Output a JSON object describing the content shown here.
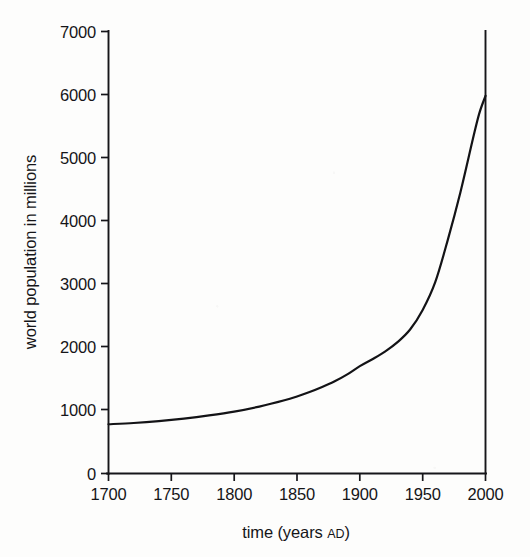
{
  "figure": {
    "background_color": "#fdfdfc",
    "ink_color": "#131316"
  },
  "chart_data": {
    "type": "line",
    "title": "",
    "xlabel": "time (years AD)",
    "xlabel_main": "time (years ",
    "xlabel_smallcaps": "AD",
    "xlabel_tail": ")",
    "ylabel": "world population in millions",
    "xlim": [
      1700,
      2000
    ],
    "ylim": [
      0,
      7000
    ],
    "grid": false,
    "legend": "none",
    "x_ticks": [
      1700,
      1750,
      1800,
      1850,
      1900,
      1950,
      2000
    ],
    "x_tick_labels": [
      "1700",
      "1750",
      "1800",
      "1850",
      "1900",
      "1950",
      "2000"
    ],
    "y_ticks": [
      0,
      1000,
      2000,
      3000,
      4000,
      5000,
      6000,
      7000
    ],
    "y_tick_labels": [
      "0",
      "1000",
      "2000",
      "3000",
      "4000",
      "5000",
      "6000",
      "7000"
    ],
    "series": [
      {
        "name": "world population",
        "color": "#131316",
        "x": [
          1700,
          1720,
          1740,
          1760,
          1780,
          1800,
          1820,
          1840,
          1850,
          1860,
          1870,
          1880,
          1890,
          1900,
          1910,
          1920,
          1930,
          1940,
          1950,
          1960,
          1970,
          1980,
          1990,
          1995,
          2000
        ],
        "values": [
          780,
          800,
          830,
          870,
          920,
          980,
          1060,
          1160,
          1220,
          1290,
          1370,
          1460,
          1570,
          1700,
          1810,
          1930,
          2080,
          2280,
          2590,
          3030,
          3700,
          4450,
          5300,
          5700,
          5980
        ]
      }
    ],
    "annotations": [
      {
        "name": "right-boundary-line",
        "description": "vertical rule drawn at x = 2000 from the curve top up to y = 7000",
        "x": 2000,
        "y_from": 5980,
        "y_to": 7000
      }
    ]
  },
  "axes": {
    "y_axis_name": "y-axis",
    "x_axis_name": "x-axis",
    "tick_direction": "outward"
  }
}
